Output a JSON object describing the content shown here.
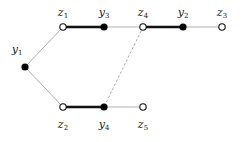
{
  "diagram": {
    "type": "graph",
    "colors": {
      "thin_edge": "#b0b0b0",
      "thick_edge": "#111111",
      "dashed_edge": "#a0a0a0",
      "filled_node": "#000000",
      "open_node_fill": "#ffffff",
      "open_node_stroke": "#111111"
    },
    "nodes": [
      {
        "id": "y1",
        "base": "y",
        "sub": "1",
        "x": 25,
        "y": 67,
        "filled": true,
        "label_pos": "above-left"
      },
      {
        "id": "z1",
        "base": "z",
        "sub": "1",
        "x": 63,
        "y": 27,
        "filled": false,
        "label_pos": "above"
      },
      {
        "id": "y3",
        "base": "y",
        "sub": "3",
        "x": 104,
        "y": 27,
        "filled": true,
        "label_pos": "above"
      },
      {
        "id": "z4",
        "base": "z",
        "sub": "4",
        "x": 143,
        "y": 27,
        "filled": false,
        "label_pos": "above"
      },
      {
        "id": "y2",
        "base": "y",
        "sub": "2",
        "x": 183,
        "y": 27,
        "filled": true,
        "label_pos": "above"
      },
      {
        "id": "z3",
        "base": "z",
        "sub": "3",
        "x": 222,
        "y": 27,
        "filled": false,
        "label_pos": "above"
      },
      {
        "id": "z2",
        "base": "z",
        "sub": "2",
        "x": 63,
        "y": 107,
        "filled": false,
        "label_pos": "below"
      },
      {
        "id": "y4",
        "base": "y",
        "sub": "4",
        "x": 104,
        "y": 107,
        "filled": true,
        "label_pos": "below"
      },
      {
        "id": "z5",
        "base": "z",
        "sub": "5",
        "x": 143,
        "y": 107,
        "filled": false,
        "label_pos": "below"
      }
    ],
    "edges": [
      {
        "from": "y1",
        "to": "z1",
        "style": "thin"
      },
      {
        "from": "y1",
        "to": "z2",
        "style": "thin"
      },
      {
        "from": "z1",
        "to": "y3",
        "style": "thick"
      },
      {
        "from": "y3",
        "to": "z4",
        "style": "thin"
      },
      {
        "from": "z4",
        "to": "y2",
        "style": "thick"
      },
      {
        "from": "y2",
        "to": "z3",
        "style": "thin"
      },
      {
        "from": "z2",
        "to": "y4",
        "style": "thick"
      },
      {
        "from": "y4",
        "to": "z5",
        "style": "thin"
      },
      {
        "from": "z4",
        "to": "y4",
        "style": "dashed"
      }
    ]
  }
}
